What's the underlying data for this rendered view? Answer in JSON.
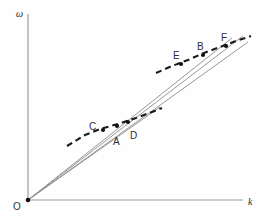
{
  "figure": {
    "background_color": "#fefefe",
    "width": 267,
    "height": 222
  },
  "axes": {
    "origin_label": "O",
    "origin_label_x": 13,
    "origin_label_y": 202,
    "x_axis": {
      "label": "k",
      "label_x": 248,
      "label_y": 197,
      "color": "#9a9a9a",
      "x1": 28,
      "y1": 200,
      "x2": 243,
      "y2": 200
    },
    "y_axis": {
      "label": "ω",
      "label_x": 16,
      "label_y": 9,
      "color": "#9a9a9a",
      "x1": 28,
      "y1": 200,
      "x2": 28,
      "y2": 14
    }
  },
  "chart_data": {
    "type": "line",
    "title": "",
    "xlabel": "k",
    "ylabel": "ω",
    "grid": false,
    "legend": null,
    "ray_color": "#8c8c8c",
    "dash_color": "#1a1a1a",
    "point_color": "#111111",
    "origin": {
      "x": 28,
      "y": 200
    },
    "rays": [
      {
        "name": "ray-through-C-E",
        "x1": 28,
        "y1": 200,
        "x2": 232,
        "y2": 38
      },
      {
        "name": "ray-through-A-B",
        "x1": 28,
        "y1": 200,
        "x2": 243,
        "y2": 36
      },
      {
        "name": "ray-through-D-F",
        "x1": 28,
        "y1": 200,
        "x2": 248,
        "y2": 42
      },
      {
        "name": "ray-steep-upper",
        "x1": 28,
        "y1": 200,
        "x2": 160,
        "y2": 107
      }
    ],
    "dashed_curves": [
      {
        "name": "lower-acoustic-branch",
        "points": [
          [
            67,
            146
          ],
          [
            85,
            135
          ],
          [
            100,
            129
          ],
          [
            118,
            124
          ],
          [
            136,
            118
          ],
          [
            152,
            112
          ],
          [
            162,
            108
          ]
        ]
      },
      {
        "name": "upper-optical-branch",
        "points": [
          [
            156,
            73
          ],
          [
            172,
            66
          ],
          [
            188,
            60
          ],
          [
            204,
            53
          ],
          [
            220,
            47
          ],
          [
            236,
            41
          ],
          [
            251,
            36
          ]
        ]
      }
    ],
    "points": [
      {
        "label": "A",
        "x": 117,
        "y": 126,
        "label_x": 113,
        "label_y": 137
      },
      {
        "label": "B",
        "x": 203,
        "y": 55,
        "label_x": 197,
        "label_y": 42
      },
      {
        "label": "C",
        "x": 103,
        "y": 130,
        "label_x": 89,
        "label_y": 122
      },
      {
        "label": "D",
        "x": 128,
        "y": 122,
        "label_x": 130,
        "label_y": 131
      },
      {
        "label": "E",
        "x": 181,
        "y": 64,
        "label_x": 173,
        "label_y": 51
      },
      {
        "label": "F",
        "x": 226,
        "y": 46,
        "label_x": 221,
        "label_y": 33
      }
    ]
  }
}
